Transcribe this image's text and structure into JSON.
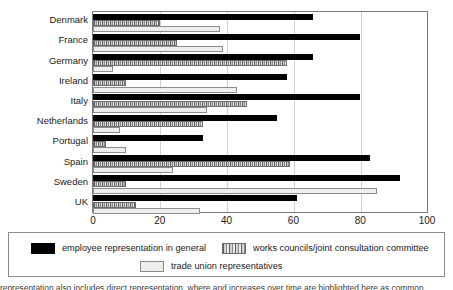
{
  "chart_data": {
    "type": "bar",
    "orientation": "horizontal",
    "title": "",
    "xlabel": "",
    "ylabel": "",
    "xlim": [
      0,
      100
    ],
    "xticks": [
      0,
      20,
      40,
      60,
      80,
      100
    ],
    "grid": true,
    "legend_position": "bottom",
    "categories": [
      "Denmark",
      "France",
      "Germany",
      "Ireland",
      "Italy",
      "Netherlands",
      "Portugal",
      "Spain",
      "Sweden",
      "UK"
    ],
    "series": [
      {
        "name": "employee representation in general",
        "key": "general",
        "color": "#000000",
        "values": [
          66,
          80,
          66,
          58,
          80,
          55,
          33,
          83,
          92,
          61
        ]
      },
      {
        "name": "works councils/joint consultation committee",
        "key": "works",
        "color": "#8a8a8a",
        "values": [
          20,
          25,
          58,
          10,
          46,
          33,
          4,
          59,
          10,
          13
        ]
      },
      {
        "name": "trade union representatives",
        "key": "union",
        "color": "#eeeeee",
        "values": [
          38,
          39,
          6,
          43,
          34,
          8,
          10,
          24,
          85,
          32
        ]
      }
    ]
  },
  "legend": {
    "entries": [
      {
        "label": "employee representation in general",
        "swatch": "general"
      },
      {
        "label": "works councils/joint consultation committee",
        "swatch": "works"
      },
      {
        "label": "trade union representatives",
        "swatch": "union"
      }
    ]
  },
  "caption": {
    "text": "representation also includes direct representation, where and increases over time are highlighted here as common."
  }
}
